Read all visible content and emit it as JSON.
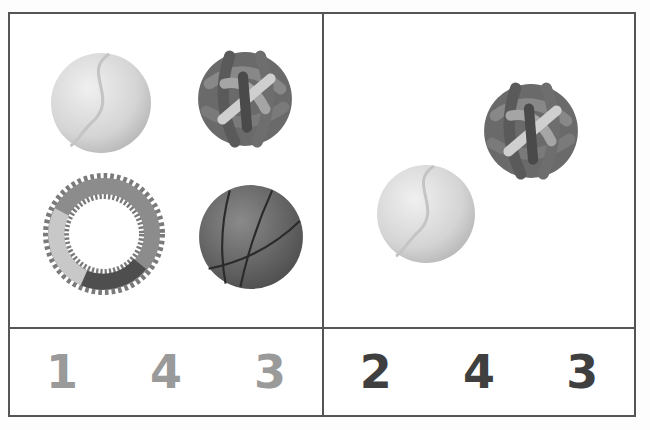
{
  "worksheet": {
    "left_panel": {
      "items": [
        "tennis-ball",
        "knot-ball",
        "spiky-ring",
        "basketball"
      ],
      "answer_choices": [
        "1",
        "4",
        "3"
      ]
    },
    "right_panel": {
      "items": [
        "knot-ball",
        "tennis-ball"
      ],
      "answer_choices": [
        "2",
        "4",
        "3"
      ]
    },
    "colors": {
      "border": "#555555",
      "light_number": "#9a9a9a",
      "dark_number": "#3f3f3f"
    }
  }
}
